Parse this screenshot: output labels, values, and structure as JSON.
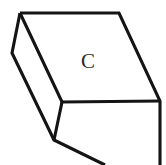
{
  "figure": {
    "canvas": {
      "width": 166,
      "height": 165,
      "background": "#ffffff"
    },
    "style": {
      "stroke_color": "#141414",
      "stroke_width": 3.1,
      "fill_color": "#ffffff",
      "label_color": "#2b2b2b"
    },
    "vertices": {
      "top_back_left": {
        "x": 20,
        "y": 13
      },
      "top_back_right": {
        "x": 119,
        "y": 13
      },
      "top_front_right": {
        "x": 160,
        "y": 101
      },
      "top_front_left": {
        "x": 62,
        "y": 102
      },
      "left_back_bottom": {
        "x": 12,
        "y": 53
      },
      "left_front_bottom": {
        "x": 54,
        "y": 140
      },
      "bottom_edge_exit": {
        "x": 105,
        "y": 165
      },
      "right_edge_exit": {
        "x": 160,
        "y": 165
      }
    },
    "faces": [
      {
        "name": "top-face",
        "points": "20,13 119,13 160,101 62,102",
        "label": "C",
        "label_position": {
          "x": 88,
          "y": 61
        }
      },
      {
        "name": "left-face",
        "points": "20,13 62,102 54,140 12,53",
        "label": "",
        "label_position": null
      },
      {
        "name": "front-face",
        "points": "62,102 160,101 160,165 105,165 54,140",
        "label": "",
        "label_position": null
      }
    ],
    "edges": [
      {
        "name": "top-back-edge",
        "from": "20,13",
        "to": "119,13"
      },
      {
        "name": "top-right-edge",
        "from": "119,13",
        "to": "160,101"
      },
      {
        "name": "top-front-edge",
        "from": "160,101",
        "to": "62,102"
      },
      {
        "name": "top-left-edge",
        "from": "62,102",
        "to": "20,13"
      },
      {
        "name": "left-back-vertical-edge",
        "from": "20,13",
        "to": "12,53"
      },
      {
        "name": "left-bottom-edge",
        "from": "12,53",
        "to": "54,140"
      },
      {
        "name": "left-front-vertical-edge",
        "from": "54,140",
        "to": "62,102"
      },
      {
        "name": "front-bottom-edge",
        "from": "54,140",
        "to": "105,165"
      },
      {
        "name": "right-vertical-edge",
        "from": "160,101",
        "to": "160,165"
      }
    ],
    "labels": {
      "face_c": "C"
    }
  }
}
